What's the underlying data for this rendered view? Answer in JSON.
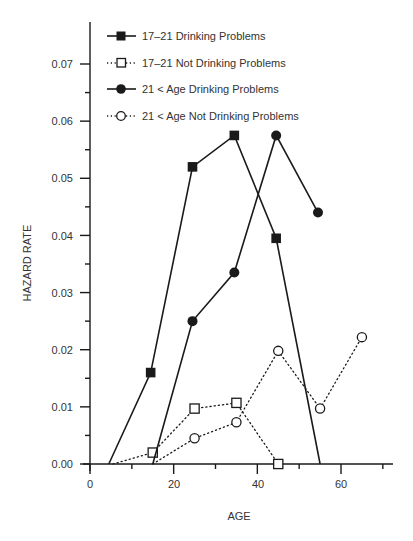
{
  "chart_data": {
    "type": "line",
    "title": "",
    "xlabel": "AGE",
    "ylabel": "HAZARD RATE",
    "xlim": [
      0,
      72
    ],
    "ylim": [
      0.0,
      0.075
    ],
    "x_ticks": [
      0,
      20,
      40,
      60
    ],
    "x_minor_ticks": [
      10,
      30,
      50,
      70
    ],
    "y_ticks": [
      0.0,
      0.01,
      0.02,
      0.03,
      0.04,
      0.05,
      0.06,
      0.07
    ],
    "y_tick_labels": [
      "0.00",
      "0.01",
      "0.02",
      "0.03",
      "0.04",
      "0.05",
      "0.06",
      "0.07"
    ],
    "grid": false,
    "legend_position": "top-left inside",
    "series": [
      {
        "name": "17–21  Drinking Problems",
        "style": "solid",
        "marker": "filled-square",
        "points": [
          [
            4.5,
            0.0
          ],
          [
            14.5,
            0.016
          ],
          [
            24.5,
            0.052
          ],
          [
            34.5,
            0.0575
          ],
          [
            44.5,
            0.0395
          ],
          [
            55,
            0.0
          ]
        ],
        "marked_indices": [
          1,
          2,
          3,
          4
        ]
      },
      {
        "name": "17–21  Not Drinking Problems",
        "style": "dotted",
        "marker": "open-square",
        "points": [
          [
            5.5,
            0.0
          ],
          [
            15,
            0.002
          ],
          [
            25,
            0.0097
          ],
          [
            35,
            0.0107
          ],
          [
            45,
            0.0
          ]
        ],
        "marked_indices": [
          1,
          2,
          3,
          4
        ]
      },
      {
        "name": "21 < Age  Drinking Problems",
        "style": "solid",
        "marker": "filled-circle",
        "points": [
          [
            15,
            0.0
          ],
          [
            24.5,
            0.025
          ],
          [
            34.5,
            0.0335
          ],
          [
            44.5,
            0.0575
          ],
          [
            54.5,
            0.044
          ]
        ],
        "marked_indices": [
          1,
          2,
          3,
          4
        ]
      },
      {
        "name": "21 < Age  Not Drinking Problems",
        "style": "dotted",
        "marker": "open-circle",
        "points": [
          [
            15,
            0.0
          ],
          [
            25,
            0.0045
          ],
          [
            35,
            0.0073
          ],
          [
            45,
            0.0198
          ],
          [
            55,
            0.0097
          ],
          [
            65,
            0.0222
          ]
        ],
        "marked_indices": [
          1,
          2,
          3,
          4,
          5
        ]
      }
    ]
  },
  "legend": {
    "items": [
      {
        "label": "17–21  Drinking Problems"
      },
      {
        "label": "17–21  Not Drinking Problems"
      },
      {
        "label": "21 < Age  Drinking Problems"
      },
      {
        "label": "21 < Age  Not Drinking Problems"
      }
    ]
  },
  "axes": {
    "x_title": "AGE",
    "y_title": "HAZARD RATE",
    "x_tick_labels": [
      "0",
      "20",
      "40",
      "60"
    ],
    "y_tick_labels": [
      "0.00",
      "0.01",
      "0.02",
      "0.03",
      "0.04",
      "0.05",
      "0.06",
      "0.07"
    ]
  },
  "colors": {
    "ink": "#1a1a1a",
    "text": "#333333",
    "background": "#ffffff"
  }
}
